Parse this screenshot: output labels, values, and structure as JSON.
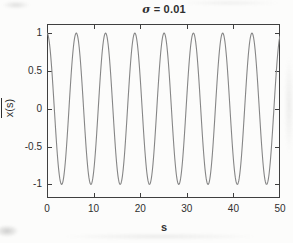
{
  "figure": {
    "title_sigma": "σ",
    "title_rest": " = 0.01",
    "xlabel": "s",
    "ylabel": "x(s)"
  },
  "chart_data": {
    "type": "line",
    "title": "σ = 0.01",
    "xlabel": "s",
    "ylabel": "x̄(s)",
    "xlim": [
      0,
      50
    ],
    "ylim": [
      -1.18,
      1.12
    ],
    "x_ticks": [
      0,
      10,
      20,
      30,
      40,
      50
    ],
    "y_ticks": [
      1,
      0.5,
      0,
      -0.5,
      -1
    ],
    "grid": false,
    "box": true,
    "series": [
      {
        "name": "x̄(s) = cos(s)",
        "model": "y = amplitude * cos(omega * s + phase)",
        "amplitude": 1,
        "omega": 1,
        "phase": 0,
        "x_range": [
          0,
          50
        ],
        "samples": 600
      }
    ],
    "colors": {
      "line": "#868686",
      "axis": "#3f3f3f",
      "text": "#2f2f2f",
      "background": "#fcfcfb"
    }
  }
}
